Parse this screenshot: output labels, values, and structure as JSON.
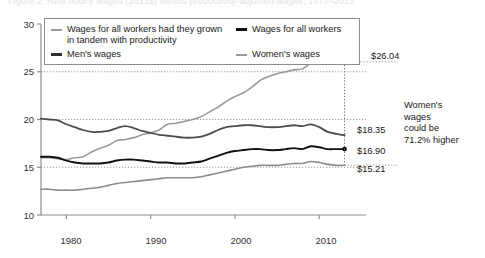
{
  "clipped_title": "Figure 2. Real hourly wages (2013$) versus productivity-adjusted wages, 1977–2013",
  "chart_data": {
    "type": "line",
    "title": "",
    "xlabel": "",
    "ylabel": "",
    "xlim": [
      1977,
      2014
    ],
    "ylim": [
      10,
      30
    ],
    "ytick_labels": [
      "10",
      "15",
      "20",
      "25",
      "30"
    ],
    "ytick_values": [
      10,
      15,
      20,
      25,
      30
    ],
    "xtick_labels": [
      "1980",
      "1990",
      "2000",
      "2010"
    ],
    "xtick_values": [
      1980,
      1990,
      2000,
      2010
    ],
    "gridlines": {
      "y": [
        15,
        20,
        25
      ],
      "style": "dotted",
      "x": false
    },
    "legend_position": "top-left",
    "series": [
      {
        "name": "Wages for all workers had they grown\nin tandem with productivity",
        "color": "#9a9a9a",
        "width": 1.6,
        "end_label": "$26.04",
        "end_value": 26.04,
        "x": [
          1977,
          1978,
          1979,
          1980,
          1981,
          1982,
          1983,
          1984,
          1985,
          1986,
          1987,
          1988,
          1989,
          1990,
          1991,
          1992,
          1993,
          1994,
          1995,
          1996,
          1997,
          1998,
          1999,
          2000,
          2001,
          2002,
          2003,
          2004,
          2005,
          2006,
          2007,
          2008,
          2009,
          2010,
          2011,
          2012,
          2013
        ],
        "values": [
          16.0,
          16.0,
          15.9,
          15.8,
          16.0,
          16.1,
          16.6,
          17.0,
          17.3,
          17.8,
          17.9,
          18.1,
          18.4,
          18.6,
          18.9,
          19.5,
          19.6,
          19.8,
          20.0,
          20.3,
          20.8,
          21.3,
          21.9,
          22.4,
          22.8,
          23.4,
          24.1,
          24.5,
          24.8,
          25.0,
          25.2,
          25.3,
          25.9,
          26.3,
          26.2,
          26.1,
          26.04
        ]
      },
      {
        "name": "Men's wages",
        "color": "#4d4d4d",
        "width": 1.8,
        "end_label": "$18.35",
        "end_value": 18.35,
        "x": [
          1977,
          1978,
          1979,
          1980,
          1981,
          1982,
          1983,
          1984,
          1985,
          1986,
          1987,
          1988,
          1989,
          1990,
          1991,
          1992,
          1993,
          1994,
          1995,
          1996,
          1997,
          1998,
          1999,
          2000,
          2001,
          2002,
          2003,
          2004,
          2005,
          2006,
          2007,
          2008,
          2009,
          2010,
          2011,
          2012,
          2013
        ],
        "values": [
          20.1,
          20.0,
          19.9,
          19.5,
          19.2,
          18.9,
          18.7,
          18.7,
          18.8,
          19.1,
          19.3,
          19.1,
          18.8,
          18.6,
          18.4,
          18.3,
          18.2,
          18.1,
          18.1,
          18.2,
          18.5,
          18.9,
          19.2,
          19.3,
          19.4,
          19.4,
          19.3,
          19.2,
          19.2,
          19.3,
          19.4,
          19.3,
          19.5,
          19.2,
          18.7,
          18.5,
          18.35
        ]
      },
      {
        "name": "Wages for all workers",
        "color": "#111111",
        "width": 1.9,
        "end_label": "$16.90",
        "end_value": 16.9,
        "x": [
          1977,
          1978,
          1979,
          1980,
          1981,
          1982,
          1983,
          1984,
          1985,
          1986,
          1987,
          1988,
          1989,
          1990,
          1991,
          1992,
          1993,
          1994,
          1995,
          1996,
          1997,
          1998,
          1999,
          2000,
          2001,
          2002,
          2003,
          2004,
          2005,
          2006,
          2007,
          2008,
          2009,
          2010,
          2011,
          2012,
          2013
        ],
        "values": [
          16.1,
          16.1,
          16.0,
          15.7,
          15.5,
          15.4,
          15.4,
          15.4,
          15.5,
          15.7,
          15.8,
          15.8,
          15.7,
          15.6,
          15.5,
          15.5,
          15.4,
          15.4,
          15.5,
          15.6,
          15.9,
          16.2,
          16.5,
          16.7,
          16.8,
          16.9,
          16.9,
          16.8,
          16.8,
          16.9,
          17.0,
          16.9,
          17.2,
          17.1,
          16.9,
          16.9,
          16.9
        ]
      },
      {
        "name": "Women's wages",
        "color": "#8c8c8c",
        "width": 1.6,
        "end_label": "$15.21",
        "end_value": 15.21,
        "x": [
          1977,
          1978,
          1979,
          1980,
          1981,
          1982,
          1983,
          1984,
          1985,
          1986,
          1987,
          1988,
          1989,
          1990,
          1991,
          1992,
          1993,
          1994,
          1995,
          1996,
          1997,
          1998,
          1999,
          2000,
          2001,
          2002,
          2003,
          2004,
          2005,
          2006,
          2007,
          2008,
          2009,
          2010,
          2011,
          2012,
          2013
        ],
        "values": [
          12.7,
          12.7,
          12.6,
          12.6,
          12.6,
          12.7,
          12.8,
          12.9,
          13.1,
          13.3,
          13.4,
          13.5,
          13.6,
          13.7,
          13.8,
          13.9,
          13.9,
          13.9,
          13.9,
          14.0,
          14.2,
          14.4,
          14.6,
          14.8,
          15.0,
          15.1,
          15.2,
          15.2,
          15.2,
          15.3,
          15.4,
          15.4,
          15.6,
          15.5,
          15.3,
          15.2,
          15.21
        ]
      }
    ],
    "annotation": {
      "text": "Women's wages could be 71.2% higher",
      "bracket_from": 26.04,
      "bracket_to": 15.21,
      "percent": "71.2%"
    }
  },
  "legend": {
    "columns": [
      [
        {
          "label": "Wages for all workers had they grown\nin tandem with productivity",
          "color": "#9a9a9a",
          "width": 2
        },
        {
          "label": "Men's wages",
          "color": "#303030",
          "width": 3
        }
      ],
      [
        {
          "label": "Wages for all workers",
          "color": "#111111",
          "width": 3
        },
        {
          "label": "Women's wages",
          "color": "#9a9a9a",
          "width": 2
        }
      ]
    ]
  },
  "annotation_lines": [
    "Women's",
    "wages",
    "could be",
    "71.2% higher"
  ],
  "axis_color": "#8e8e8e",
  "grid_color": "#a0a0a0"
}
